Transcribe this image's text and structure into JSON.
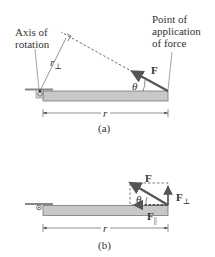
{
  "panel_a": {
    "caption": "(a)",
    "axis_label_line1": "Axis of",
    "axis_label_line2": "rotation",
    "point_label_line1": "Point of",
    "point_label_line2": "application",
    "point_label_line3": "of force",
    "force_label": "F",
    "angle_label": "θ",
    "r_perp_label": "r",
    "r_perp_sub": "⊥",
    "r_label": "r"
  },
  "panel_b": {
    "caption": "(b)",
    "force_label": "F",
    "f_perp_label": "F",
    "f_perp_sub": "⊥",
    "f_par_label": "F",
    "f_par_sub": "||",
    "angle_label": "θ",
    "r_label": "r"
  },
  "colors": {
    "bar_fill": "#c8c8c8",
    "bar_stroke": "#777777",
    "force_arrow": "#555555",
    "line": "#444444",
    "text": "#333333"
  }
}
